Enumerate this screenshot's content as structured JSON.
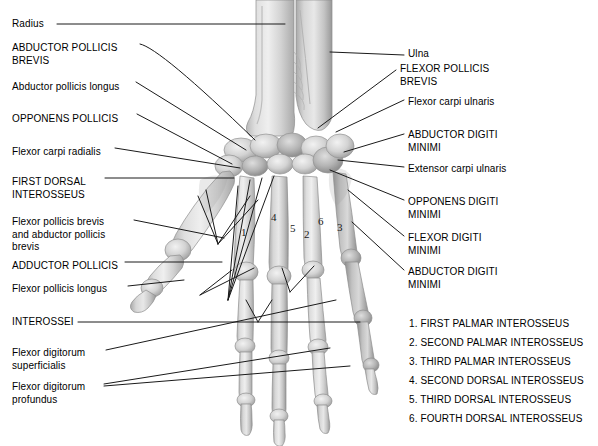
{
  "figure": {
    "background_color": "#ffffff",
    "line_color": "#1a1a1a",
    "text_color": "#000000"
  },
  "labels_left": [
    {
      "id": "radius",
      "text": "Radius",
      "x": 12,
      "y": 18,
      "style": "sentence"
    },
    {
      "id": "abductor-pollicis-brevis",
      "text": "ABDUCTOR POLLICIS\nBREVIS",
      "x": 12,
      "y": 42,
      "style": "caps"
    },
    {
      "id": "abductor-pollicis-longus",
      "text": "Abductor pollicis longus",
      "x": 12,
      "y": 81,
      "style": "sentence"
    },
    {
      "id": "opponens-pollicis",
      "text": "OPPONENS POLLICIS",
      "x": 12,
      "y": 113,
      "style": "caps"
    },
    {
      "id": "flexor-carpi-radialis",
      "text": "Flexor carpi radialis",
      "x": 12,
      "y": 146,
      "style": "sentence"
    },
    {
      "id": "first-dorsal-interosseus",
      "text": "FIRST DORSAL\nINTEROSSEUS",
      "x": 12,
      "y": 176,
      "style": "caps"
    },
    {
      "id": "flexor-pollicis-brevis-and-abductor-pollicis-brevis",
      "text": "Flexor pollicis brevis\nand abductor pollicis\nbrevis",
      "x": 12,
      "y": 216,
      "style": "sentence"
    },
    {
      "id": "adductor-pollicis",
      "text": "ADDUCTOR POLLICIS",
      "x": 12,
      "y": 260,
      "style": "caps"
    },
    {
      "id": "flexor-pollicis-longus",
      "text": "Flexor pollicis longus",
      "x": 12,
      "y": 283,
      "style": "sentence"
    },
    {
      "id": "interossei",
      "text": "INTEROSSEI",
      "x": 12,
      "y": 316,
      "style": "caps"
    },
    {
      "id": "flexor-digitorum-superficialis",
      "text": "Flexor digitorum\nsuperficialis",
      "x": 12,
      "y": 347,
      "style": "sentence"
    },
    {
      "id": "flexor-digitorum-profundus",
      "text": "Flexor digitorum\nprofundus",
      "x": 12,
      "y": 381,
      "style": "sentence"
    }
  ],
  "labels_right": [
    {
      "id": "ulna",
      "text": "Ulna",
      "x": 408,
      "y": 48,
      "style": "sentence"
    },
    {
      "id": "flexor-pollicis-brevis",
      "text": "FLEXOR POLLICIS\nBREVIS",
      "x": 400,
      "y": 63,
      "style": "caps"
    },
    {
      "id": "flexor-carpi-ulnaris",
      "text": "Flexor carpi ulnaris",
      "x": 408,
      "y": 96,
      "style": "sentence"
    },
    {
      "id": "abductor-digiti-minimi-upper",
      "text": "ABDUCTOR DIGITI\nMINIMI",
      "x": 408,
      "y": 129,
      "style": "caps"
    },
    {
      "id": "extensor-carpi-ulnaris",
      "text": "Extensor carpi ulnaris",
      "x": 408,
      "y": 163,
      "style": "sentence"
    },
    {
      "id": "opponens-digiti-minimi",
      "text": "OPPONENS DIGITI\nMINIMI",
      "x": 408,
      "y": 196,
      "style": "caps"
    },
    {
      "id": "flexor-digiti-minimi",
      "text": "FLEXOR DIGITI\nMINIMI",
      "x": 408,
      "y": 232,
      "style": "caps"
    },
    {
      "id": "abductor-digiti-minimi-lower",
      "text": "ABDUCTOR DIGITI\nMINIMI",
      "x": 408,
      "y": 266,
      "style": "caps"
    }
  ],
  "legend": [
    {
      "number": "1.",
      "text": "FIRST PALMAR INTEROSSEUS",
      "x": 409,
      "y": 318
    },
    {
      "number": "2.",
      "text": "SECOND PALMAR INTEROSSEUS",
      "x": 409,
      "y": 337
    },
    {
      "number": "3.",
      "text": "THIRD PALMAR INTEROSSEUS",
      "x": 409,
      "y": 356
    },
    {
      "number": "4.",
      "text": "SECOND DORSAL INTEROSSEUS",
      "x": 409,
      "y": 375
    },
    {
      "number": "5.",
      "text": "THIRD DORSAL INTEROSSEUS",
      "x": 409,
      "y": 394
    },
    {
      "number": "6.",
      "text": "FOURTH DORSAL INTEROSSEUS",
      "x": 409,
      "y": 413
    }
  ],
  "number_callouts": [
    {
      "id": "callout-1",
      "text": "1",
      "x": 241,
      "y": 226
    },
    {
      "id": "callout-4",
      "text": "4",
      "x": 271,
      "y": 211
    },
    {
      "id": "callout-5",
      "text": "5",
      "x": 290,
      "y": 222
    },
    {
      "id": "callout-2",
      "text": "2",
      "x": 304,
      "y": 228
    },
    {
      "id": "callout-6",
      "text": "6",
      "x": 318,
      "y": 215
    },
    {
      "id": "callout-3",
      "text": "3",
      "x": 337,
      "y": 221
    }
  ]
}
